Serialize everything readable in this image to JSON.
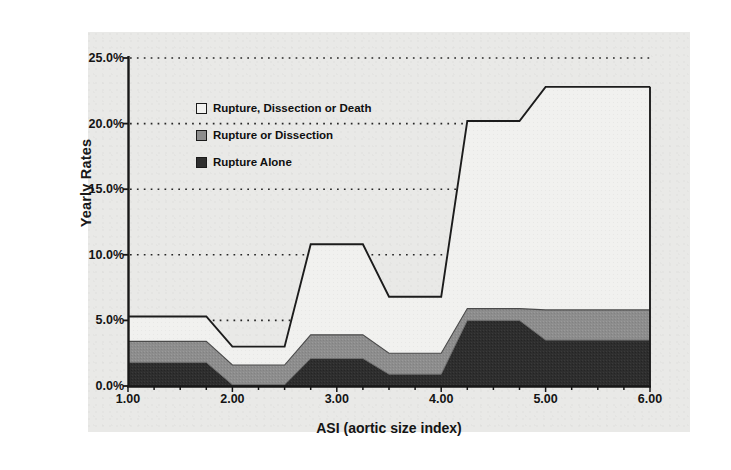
{
  "chart_data": {
    "type": "area",
    "title": "",
    "subtitle": "",
    "xlabel": "ASI (aortic size index)",
    "ylabel": "Yearly Rates",
    "xlim": [
      1.0,
      6.0
    ],
    "ylim": [
      0.0,
      25.0
    ],
    "grid": "horizontal-dotted",
    "legend_position": "inside-upper-left",
    "xticks": [
      "1.00",
      "2.00",
      "3.00",
      "4.00",
      "5.00",
      "6.00"
    ],
    "xtick_values": [
      1.0,
      2.0,
      3.0,
      4.0,
      5.0,
      6.0
    ],
    "yticks": [
      "0.0%",
      "5.0%",
      "10.0%",
      "15.0%",
      "20.0%",
      "25.0%"
    ],
    "ytick_values": [
      0.0,
      5.0,
      10.0,
      15.0,
      20.0,
      25.0
    ],
    "x": [
      1.0,
      1.75,
      2.0,
      2.5,
      2.75,
      3.25,
      3.5,
      4.0,
      4.25,
      4.75,
      5.0,
      6.0
    ],
    "series": [
      {
        "name": "Rupture, Dissection or Death",
        "color": "#f2f2f0",
        "marker": "white-square",
        "values": [
          5.3,
          5.3,
          3.0,
          3.0,
          10.8,
          10.8,
          6.8,
          6.8,
          20.2,
          20.2,
          22.8,
          22.8
        ]
      },
      {
        "name": "Rupture or Dissection",
        "color": "#8d8d8d",
        "marker": "gray-square",
        "values": [
          3.4,
          3.4,
          1.6,
          1.6,
          3.9,
          3.9,
          2.5,
          2.5,
          5.9,
          5.9,
          5.8,
          5.8
        ]
      },
      {
        "name": "Rupture Alone",
        "color": "#2e2e2e",
        "marker": "dark-square",
        "values": [
          1.8,
          1.8,
          0.1,
          0.1,
          2.1,
          2.1,
          0.9,
          0.9,
          5.0,
          5.0,
          3.5,
          3.5
        ]
      }
    ]
  },
  "legend": {
    "items": [
      {
        "label": "Rupture, Dissection or Death",
        "swatch": "white-square"
      },
      {
        "label": "Rupture or Dissection",
        "swatch": "gray-square"
      },
      {
        "label": "Rupture Alone",
        "swatch": "dark-square"
      }
    ]
  },
  "axes": {
    "y_title": "Yearly Rates",
    "x_title": "ASI (aortic size index)",
    "y_labels": [
      "25.0%",
      "20.0%",
      "15.0%",
      "10.0%",
      "5.0%",
      "0.0%"
    ],
    "x_labels": [
      "1.00",
      "2.00",
      "3.00",
      "4.00",
      "5.00",
      "6.00"
    ]
  },
  "colors": {
    "panel_background": "#e9e9e7",
    "page_background": "#ffffff",
    "axis": "#1a1a1a",
    "gridline": "#2a2a2a",
    "series_top": "#f2f2f0",
    "series_mid": "#8d8d8d",
    "series_bottom": "#2e2e2e"
  }
}
